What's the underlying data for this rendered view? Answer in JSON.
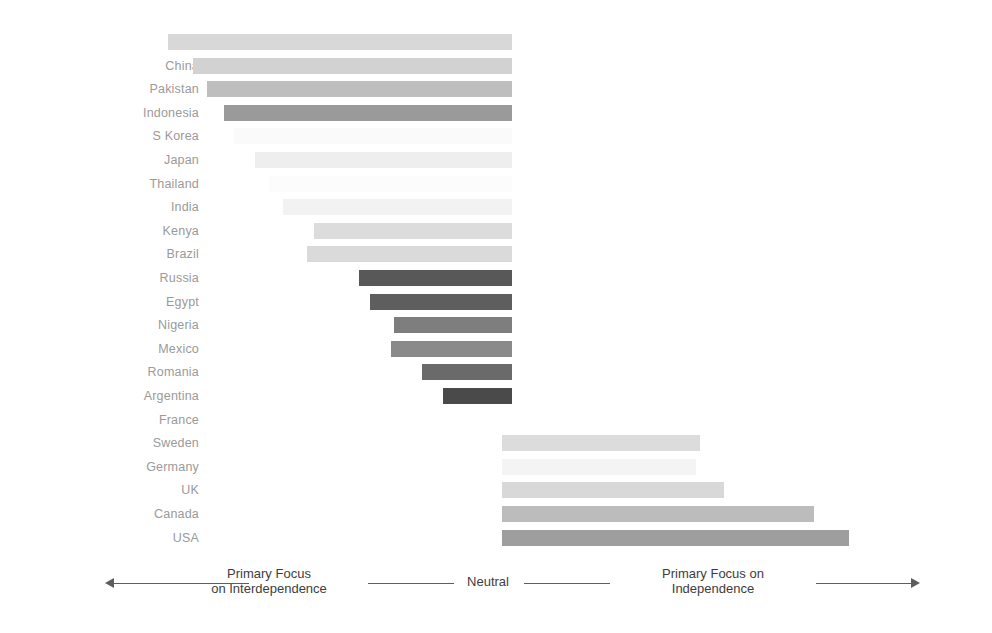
{
  "chart_data": {
    "type": "bar",
    "orientation": "horizontal",
    "subtype": "diverging",
    "title": "",
    "xlabel": "",
    "ylabel": "",
    "grid": false,
    "legend": "none",
    "axis_center_label": "Neutral",
    "axis_left_label": "Primary Focus\non Interdependence",
    "axis_right_label": "Primary Focus on\nIndependence",
    "xlim": [
      -100,
      100
    ],
    "categories": [
      "UAE",
      "China",
      "Pakistan",
      "Indonesia",
      "S Korea",
      "Japan",
      "Thailand",
      "India",
      "Kenya",
      "Brazil",
      "Russia",
      "Egypt",
      "Nigeria",
      "Mexico",
      "Romania",
      "Argentina",
      "France",
      "Sweden",
      "Germany",
      "UK",
      "Canada",
      "USA"
    ],
    "values": [
      -99,
      -92,
      -88,
      -83,
      -80,
      -74,
      -70,
      -66,
      -57,
      -59,
      -44,
      -41,
      -34,
      -35,
      -26,
      -20,
      0,
      57,
      56,
      64,
      90,
      100
    ],
    "bar_colors": [
      "#d8d8d8",
      "#d2d2d2",
      "#bebebe",
      "#9a9a9a",
      "#fafafa",
      "#eeeeee",
      "#fcfcfc",
      "#f2f2f2",
      "#dcdcdc",
      "#dadada",
      "#585858",
      "#5e5e5e",
      "#7e7e7e",
      "#8a8a8a",
      "#6a6a6a",
      "#4a4a4a",
      "#ffffff",
      "#dcdcdc",
      "#f4f4f4",
      "#d8d8d8",
      "#bcbcbc",
      "#9e9e9e"
    ],
    "label_color": "#9a9a9a",
    "axis_color": "#5d5d5d"
  }
}
